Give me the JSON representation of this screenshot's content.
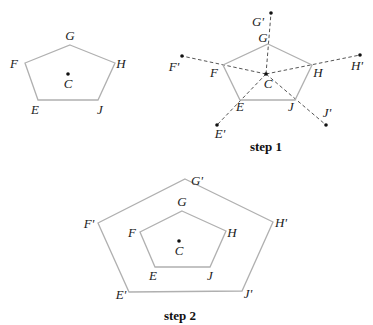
{
  "diagram": {
    "original": {
      "center": {
        "label": "C",
        "x": 68,
        "y": 74
      },
      "vertices": [
        {
          "label": "G",
          "x": 70,
          "y": 45,
          "lx": 70,
          "ly": 40
        },
        {
          "label": "H",
          "x": 115,
          "y": 63,
          "lx": 121,
          "ly": 68
        },
        {
          "label": "J",
          "x": 98,
          "y": 100,
          "lx": 100,
          "ly": 114
        },
        {
          "label": "E",
          "x": 38,
          "y": 100,
          "lx": 35,
          "ly": 114
        },
        {
          "label": "F",
          "x": 25,
          "y": 63,
          "lx": 14,
          "ly": 68
        }
      ]
    },
    "step1": {
      "caption": "step 1",
      "center": {
        "label": "C",
        "x": 266,
        "y": 74
      },
      "vertices": [
        {
          "label": "G",
          "x": 268,
          "y": 44,
          "lx": 263,
          "ly": 42
        },
        {
          "label": "H",
          "x": 312,
          "y": 65,
          "lx": 318,
          "ly": 77
        },
        {
          "label": "J",
          "x": 295,
          "y": 100,
          "lx": 291,
          "ly": 111
        },
        {
          "label": "E",
          "x": 240,
          "y": 100,
          "lx": 240,
          "ly": 111
        },
        {
          "label": "F",
          "x": 223,
          "y": 65,
          "lx": 214,
          "ly": 77
        }
      ],
      "images": [
        {
          "label": "G'",
          "x": 271,
          "y": 13,
          "lx": 258,
          "ly": 26
        },
        {
          "label": "H'",
          "x": 360,
          "y": 55,
          "lx": 357,
          "ly": 70
        },
        {
          "label": "J'",
          "x": 326,
          "y": 125,
          "lx": 327,
          "ly": 117
        },
        {
          "label": "E'",
          "x": 217,
          "y": 125,
          "lx": 220,
          "ly": 138
        },
        {
          "label": "F'",
          "x": 182,
          "y": 56,
          "lx": 174,
          "ly": 71
        }
      ],
      "caption_x": 266,
      "caption_y": 151
    },
    "step2": {
      "caption": "step 2",
      "center": {
        "label": "C",
        "x": 179,
        "y": 241
      },
      "inner": [
        {
          "label": "G",
          "x": 182,
          "y": 211,
          "lx": 182,
          "ly": 206
        },
        {
          "label": "H",
          "x": 226,
          "y": 231,
          "lx": 232,
          "ly": 237
        },
        {
          "label": "J",
          "x": 210,
          "y": 267,
          "lx": 210,
          "ly": 280
        },
        {
          "label": "E",
          "x": 155,
          "y": 267,
          "lx": 153,
          "ly": 280
        },
        {
          "label": "F",
          "x": 140,
          "y": 232,
          "lx": 132,
          "ly": 237
        }
      ],
      "outer": [
        {
          "label": "G'",
          "x": 185,
          "y": 179,
          "lx": 197,
          "ly": 185
        },
        {
          "label": "H'",
          "x": 273,
          "y": 222,
          "lx": 281,
          "ly": 227
        },
        {
          "label": "J'",
          "x": 242,
          "y": 291,
          "lx": 248,
          "ly": 298
        },
        {
          "label": "E'",
          "x": 129,
          "y": 292,
          "lx": 121,
          "ly": 299
        },
        {
          "label": "F'",
          "x": 98,
          "y": 223,
          "lx": 89,
          "ly": 228
        }
      ],
      "caption_x": 180,
      "caption_y": 320
    },
    "colors": {
      "polygon": "#b0b0b0",
      "dash": "#555555",
      "dot": "#111111"
    }
  }
}
